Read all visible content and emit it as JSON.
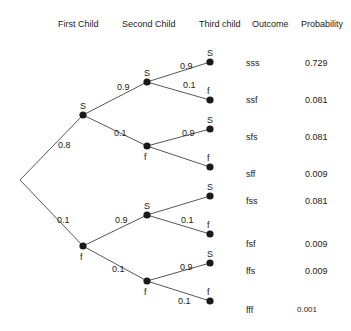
{
  "headers": {
    "first_child": "First Child",
    "second_child": "Second Child",
    "third_child": "Third child",
    "outcome": "Outcome",
    "probability": "Probability"
  },
  "tree": {
    "root": {
      "x": 20,
      "y": 180
    },
    "nodes": [
      {
        "id": "s",
        "x": 83,
        "y": 115,
        "label": "S",
        "label_pos": "above"
      },
      {
        "id": "f",
        "x": 83,
        "y": 246,
        "label": "f",
        "label_pos": "below"
      },
      {
        "id": "ss",
        "x": 147,
        "y": 82,
        "label": "S",
        "label_pos": "above"
      },
      {
        "id": "sf",
        "x": 147,
        "y": 146,
        "label": "f",
        "label_pos": "below"
      },
      {
        "id": "fs",
        "x": 147,
        "y": 215,
        "label": "S",
        "label_pos": "above"
      },
      {
        "id": "ff",
        "x": 147,
        "y": 281,
        "label": "f",
        "label_pos": "below"
      },
      {
        "id": "sss",
        "x": 210,
        "y": 62,
        "label": "S",
        "label_pos": "above"
      },
      {
        "id": "ssf",
        "x": 210,
        "y": 100,
        "label": "f",
        "label_pos": "above"
      },
      {
        "id": "sfs",
        "x": 210,
        "y": 129,
        "label": "S",
        "label_pos": "above"
      },
      {
        "id": "sff",
        "x": 210,
        "y": 167,
        "label": "f",
        "label_pos": "above"
      },
      {
        "id": "fss",
        "x": 210,
        "y": 196,
        "label": "S",
        "label_pos": "above"
      },
      {
        "id": "fsf",
        "x": 210,
        "y": 234,
        "label": "f",
        "label_pos": "above"
      },
      {
        "id": "ffs",
        "x": 210,
        "y": 263,
        "label": "S",
        "label_pos": "above"
      },
      {
        "id": "fff",
        "x": 210,
        "y": 301,
        "label": "f",
        "label_pos": "above"
      }
    ],
    "edges": [
      {
        "from": "root",
        "to": "s",
        "prob": "0.8",
        "lx": 58,
        "ly": 148
      },
      {
        "from": "root",
        "to": "f",
        "prob": "0.1",
        "lx": 57,
        "ly": 223
      },
      {
        "from": "s",
        "to": "ss",
        "prob": "0.9",
        "lx": 117,
        "ly": 90
      },
      {
        "from": "s",
        "to": "sf",
        "prob": "0.1",
        "lx": 114,
        "ly": 136
      },
      {
        "from": "f",
        "to": "fs",
        "prob": "0.9",
        "lx": 115,
        "ly": 223
      },
      {
        "from": "f",
        "to": "ff",
        "prob": "0.1",
        "lx": 112,
        "ly": 272
      },
      {
        "from": "ss",
        "to": "sss",
        "prob": "0.9",
        "lx": 180,
        "ly": 69
      },
      {
        "from": "ss",
        "to": "ssf",
        "prob": "0.1",
        "lx": 183,
        "ly": 88
      },
      {
        "from": "sf",
        "to": "sfs",
        "prob": "0.9",
        "lx": 182,
        "ly": 136
      },
      {
        "from": "sf",
        "to": "sff",
        "prob": "",
        "lx": 0,
        "ly": 0
      },
      {
        "from": "fs",
        "to": "fss",
        "prob": "",
        "lx": 0,
        "ly": 0
      },
      {
        "from": "fs",
        "to": "fsf",
        "prob": "0.1",
        "lx": 181,
        "ly": 223
      },
      {
        "from": "ff",
        "to": "ffs",
        "prob": "0.9",
        "lx": 180,
        "ly": 270
      },
      {
        "from": "ff",
        "to": "fff",
        "prob": "0.1",
        "lx": 178,
        "ly": 304
      }
    ]
  },
  "outcomes": [
    {
      "outcome": "sss",
      "probability": "0.729",
      "y": 64,
      "px": 305
    },
    {
      "outcome": "ssf",
      "probability": "0.081",
      "y": 101,
      "px": 305
    },
    {
      "outcome": "sfs",
      "probability": "0.081",
      "y": 138,
      "px": 305
    },
    {
      "outcome": "sff",
      "probability": "0.009",
      "y": 175,
      "px": 305
    },
    {
      "outcome": "fss",
      "probability": "0.081",
      "y": 202,
      "px": 305
    },
    {
      "outcome": "fsf",
      "probability": "0.009",
      "y": 245,
      "px": 305
    },
    {
      "outcome": "ffs",
      "probability": "0.009",
      "y": 272,
      "px": 305
    },
    {
      "outcome": "fff",
      "probability": "0.001",
      "y": 311,
      "px": 297
    }
  ]
}
